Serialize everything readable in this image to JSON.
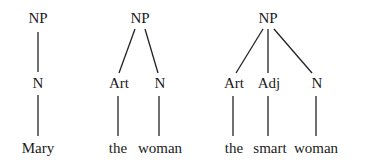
{
  "diagram": {
    "type": "syntax-trees",
    "trees": [
      {
        "root": {
          "label": "NP",
          "x": 38,
          "y": 23
        },
        "children": [
          {
            "label": "N",
            "x": 38,
            "y": 88,
            "word": "Mary",
            "wx": 38
          }
        ]
      },
      {
        "root": {
          "label": "NP",
          "x": 140,
          "y": 23
        },
        "children": [
          {
            "label": "Art",
            "x": 119,
            "y": 88,
            "word": "the",
            "wx": 118
          },
          {
            "label": "N",
            "x": 160,
            "y": 88,
            "word": "woman",
            "wx": 160
          }
        ]
      },
      {
        "root": {
          "label": "NP",
          "x": 268,
          "y": 23
        },
        "children": [
          {
            "label": "Art",
            "x": 234,
            "y": 88,
            "word": "the",
            "wx": 234
          },
          {
            "label": "Adj",
            "x": 269,
            "y": 88,
            "word": "smart",
            "wx": 270
          },
          {
            "label": "N",
            "x": 317,
            "y": 88,
            "word": "woman",
            "wx": 316
          }
        ]
      }
    ],
    "word_y": 153,
    "colors": {
      "text": "#1a1a1a",
      "line": "#222222",
      "background": "#ffffff"
    }
  },
  "labels": {
    "t1_root": "NP",
    "t1_n": "N",
    "t1_w": "Mary",
    "t2_root": "NP",
    "t2_art": "Art",
    "t2_n": "N",
    "t2_w1": "the",
    "t2_w2": "woman",
    "t3_root": "NP",
    "t3_art": "Art",
    "t3_adj": "Adj",
    "t3_n": "N",
    "t3_w1": "the",
    "t3_w2": "smart",
    "t3_w3": "woman"
  }
}
